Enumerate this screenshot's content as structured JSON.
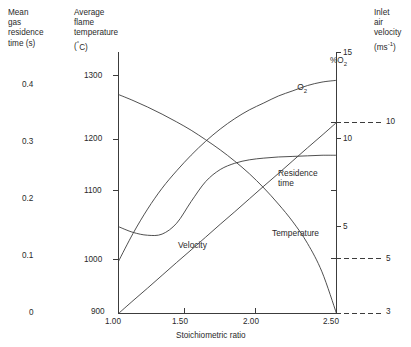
{
  "figure": {
    "left_axis": {
      "title_lines": [
        "Mean",
        "gas",
        "residence",
        "time (s)"
      ],
      "ticks": [
        {
          "label": "0.4",
          "value": 0.4
        },
        {
          "label": "0.3",
          "value": 0.3
        },
        {
          "label": "0.2",
          "value": 0.2
        },
        {
          "label": "0.1",
          "value": 0.1
        },
        {
          "label": "0",
          "value": 0
        }
      ]
    },
    "temp_axis": {
      "title_lines": [
        "Average",
        "flame",
        "temperature",
        "( C)"
      ],
      "unit_symbol": "°",
      "ticks": [
        {
          "label": "1300",
          "value": 1300
        },
        {
          "label": "1200",
          "value": 1200
        },
        {
          "label": "1100",
          "value": 1100
        },
        {
          "label": "1000",
          "value": 1000
        },
        {
          "label": "900",
          "value": 900
        }
      ]
    },
    "o2_axis": {
      "title": "%O",
      "title_sub": "2",
      "ticks": [
        {
          "label": "15",
          "value": 15
        },
        {
          "label": "10",
          "value": 10
        },
        {
          "label": "5",
          "value": 5
        }
      ]
    },
    "velocity_axis": {
      "title_lines": [
        "Inlet",
        "air",
        "velocity"
      ],
      "unit_base": "(ms",
      "unit_exp": "-1",
      "unit_close": ")",
      "ticks": [
        {
          "label": "10",
          "value": 10
        },
        {
          "label": "5",
          "value": 5
        },
        {
          "label": "3",
          "value": 3
        }
      ]
    },
    "x_axis": {
      "title": "Stoichiometric ratio",
      "ticks": [
        {
          "label": "1.00",
          "value": 1.0
        },
        {
          "label": "1.50",
          "value": 1.5
        },
        {
          "label": "2.00",
          "value": 2.0
        },
        {
          "label": "2.50",
          "value": 2.5
        }
      ]
    },
    "curve_labels": {
      "o2": "O",
      "o2_sub": "2",
      "residence": "Residence\ntime",
      "temperature": "Temperature",
      "velocity": "Velocity"
    },
    "colors": {
      "line": "#3c3c3c",
      "axis": "#3c3c3c",
      "text": "#2a2a2a",
      "background": "#ffffff"
    }
  },
  "chart_data": {
    "type": "line",
    "title": "",
    "xlabel": "Stoichiometric ratio",
    "ylabel": "Average flame temperature ( C)",
    "xlim": [
      1.0,
      2.5
    ],
    "grid": false,
    "legend": "inline-curve-labels",
    "axes": [
      {
        "name": "mean-gas-residence-time",
        "side": "far-left",
        "unit": "s",
        "range": [
          0,
          0.4
        ],
        "ticks": [
          0,
          0.1,
          0.2,
          0.3,
          0.4
        ]
      },
      {
        "name": "average-flame-temperature",
        "side": "left",
        "unit": "°C",
        "range": [
          900,
          1300
        ],
        "ticks": [
          900,
          1000,
          1100,
          1200,
          1300
        ]
      },
      {
        "name": "percent-o2",
        "side": "right",
        "unit": "%",
        "range": [
          3,
          15
        ],
        "ticks": [
          5,
          10,
          15
        ]
      },
      {
        "name": "inlet-air-velocity",
        "side": "far-right",
        "unit": "ms-1",
        "range": [
          3,
          10
        ],
        "ticks": [
          3,
          5,
          10
        ]
      }
    ],
    "x": [
      1.0,
      1.1,
      1.2,
      1.3,
      1.4,
      1.5,
      1.6,
      1.7,
      1.8,
      1.9,
      2.0,
      2.1,
      2.2,
      2.3,
      2.4,
      2.5
    ],
    "series": [
      {
        "name": "Temperature",
        "axis": "average-flame-temperature",
        "unit": "°C",
        "values": [
          1268,
          1258,
          1247,
          1235,
          1222,
          1208,
          1192,
          1175,
          1156,
          1135,
          1111,
          1084,
          1054,
          1018,
          970,
          900
        ]
      },
      {
        "name": "Residence time",
        "axis": "mean-gas-residence-time",
        "unit": "s",
        "values": [
          0.152,
          0.142,
          0.137,
          0.139,
          0.158,
          0.196,
          0.231,
          0.252,
          0.263,
          0.269,
          0.272,
          0.274,
          0.275,
          0.276,
          0.277,
          0.277
        ]
      },
      {
        "name": "O2",
        "axis": "percent-o2",
        "unit": "%",
        "values": [
          3.0,
          4.6,
          6.0,
          7.2,
          8.2,
          9.1,
          9.9,
          10.6,
          11.2,
          11.7,
          12.1,
          12.5,
          12.8,
          13.1,
          13.3,
          13.4
        ]
      },
      {
        "name": "Velocity",
        "axis": "inlet-air-velocity",
        "unit": "ms-1",
        "values": [
          3.0,
          3.47,
          3.93,
          4.4,
          4.87,
          5.33,
          5.8,
          6.27,
          6.73,
          7.2,
          7.67,
          8.13,
          8.6,
          9.07,
          9.53,
          10.0
        ]
      }
    ],
    "annotations": [
      {
        "text": "O2",
        "x": 2.0,
        "series": "O2"
      },
      {
        "text": "Residence time",
        "x": 2.2,
        "series": "Residence time"
      },
      {
        "text": "Temperature",
        "x": 2.1,
        "series": "Temperature"
      },
      {
        "text": "Velocity",
        "x": 1.55,
        "series": "Velocity"
      }
    ]
  }
}
